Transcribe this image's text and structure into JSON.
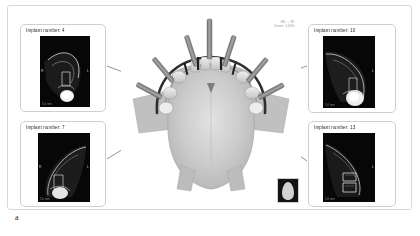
{
  "figure": {
    "letter": "a"
  },
  "viewport": {
    "meta_line1": "WL: -  W:",
    "meta_line2": "Zoom: 140%",
    "orientation_thumb_name": "orientation-thumbnail"
  },
  "panels": [
    {
      "id": "top-left",
      "title": "Implant number: 4",
      "implant_number": "4",
      "left_marker": "R",
      "right_marker": "L",
      "scale_label": "5.0 mm"
    },
    {
      "id": "top-right",
      "title": "Implant number: 10",
      "implant_number": "10",
      "left_marker": "",
      "right_marker": "L",
      "scale_label": "5.0 mm"
    },
    {
      "id": "bottom-left",
      "title": "Implant number: 7",
      "implant_number": "7",
      "left_marker": "R",
      "right_marker": "L",
      "scale_label": "5.0 mm"
    },
    {
      "id": "bottom-right",
      "title": "Implant number: 13",
      "implant_number": "13",
      "left_marker": "",
      "right_marker": "L",
      "scale_label": "5.0 mm"
    }
  ],
  "colors": {
    "frame_border": "#d8d8d8",
    "panel_border": "#cfcfcf",
    "leader_line": "#3a3a3a",
    "radiograph_bg": "#070707",
    "bone_light": "#cfcfcf",
    "bone_mid": "#b4b4b4",
    "implant_gray": "#8e8e8e",
    "text": "#2b2b2b",
    "page_bg": "#ffffff"
  }
}
